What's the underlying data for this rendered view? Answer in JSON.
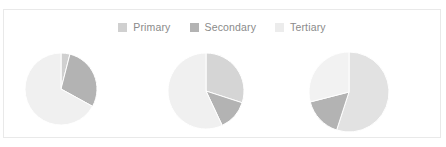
{
  "card": {
    "background": "#ffffff",
    "border_color": "#e9e9e9"
  },
  "legend": {
    "position": "top-center",
    "items": [
      {
        "label": "Primary",
        "color": "#d0d0d0",
        "swatch_name": "legend-swatch-primary"
      },
      {
        "label": "Secondary",
        "color": "#b3b3b3",
        "swatch_name": "legend-swatch-secondary"
      },
      {
        "label": "Tertiary",
        "color": "#ececec",
        "swatch_name": "legend-swatch-tertiary"
      }
    ],
    "text_color": "#8a8a8a"
  },
  "chart_data": {
    "type": "pie",
    "title": "",
    "subtitle": "",
    "xlabel": "",
    "ylabel": "",
    "grid": false,
    "legend_position": "top-center",
    "categories": [
      "Primary",
      "Secondary",
      "Tertiary"
    ],
    "colors": [
      "#d0d0d0",
      "#b3b3b3",
      "#ececec"
    ],
    "charts": [
      {
        "name": "pie-chart-1",
        "center": [
          60,
          88
        ],
        "radius": 36,
        "start_angle_deg": 0,
        "slices": [
          {
            "label": "Primary",
            "value": 4,
            "percent": 4,
            "color": "#d0d0d0"
          },
          {
            "label": "Secondary",
            "value": 29,
            "percent": 29,
            "color": "#b3b3b3"
          },
          {
            "label": "Tertiary",
            "value": 67,
            "percent": 67,
            "color": "#f0f0f0"
          }
        ]
      },
      {
        "name": "pie-chart-2",
        "center": [
          205,
          90
        ],
        "radius": 38,
        "start_angle_deg": 0,
        "slices": [
          {
            "label": "Primary",
            "value": 30,
            "percent": 30,
            "color": "#d5d5d5"
          },
          {
            "label": "Secondary",
            "value": 13,
            "percent": 13,
            "color": "#b3b3b3"
          },
          {
            "label": "Tertiary",
            "value": 57,
            "percent": 57,
            "color": "#f0f0f0"
          }
        ]
      },
      {
        "name": "pie-chart-3",
        "center": [
          348,
          91
        ],
        "radius": 40,
        "start_angle_deg": 0,
        "slices": [
          {
            "label": "Primary",
            "value": 55,
            "percent": 55,
            "color": "#e2e2e2"
          },
          {
            "label": "Secondary",
            "value": 16,
            "percent": 16,
            "color": "#b3b3b3"
          },
          {
            "label": "Tertiary",
            "value": 29,
            "percent": 29,
            "color": "#f2f2f2"
          }
        ]
      }
    ]
  }
}
